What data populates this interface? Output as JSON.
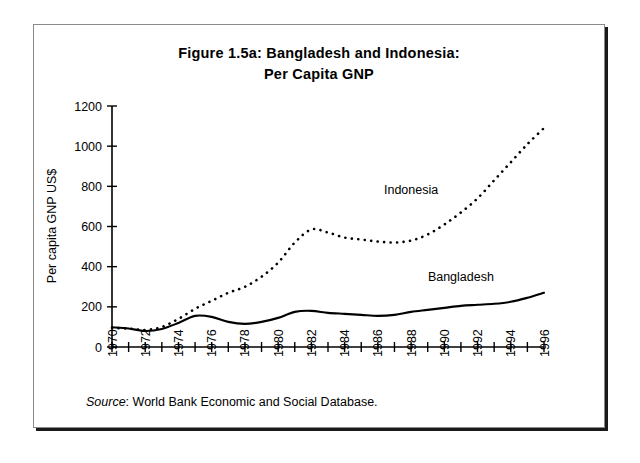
{
  "figure": {
    "title_line1": "Figure 1.5a: Bangladesh and Indonesia:",
    "title_line2": "Per Capita GNP",
    "source_word": "Source",
    "source_text": ": World Bank Economic and Social Database.",
    "frame_color": "#1a1a1a",
    "background": "#ffffff"
  },
  "chart_data": {
    "type": "line",
    "title": "Figure 1.5a: Bangladesh and Indonesia: Per Capita GNP",
    "xlabel": "",
    "ylabel": "Per capita GNP US$",
    "xlim": [
      1970,
      1996
    ],
    "ylim": [
      0,
      1200
    ],
    "ytick_step": 200,
    "xtick_step": 1,
    "xtick_label_step": 2,
    "grid": false,
    "legend_position": "inline-annotation",
    "yticks": [
      "0",
      "200",
      "400",
      "600",
      "800",
      "1000",
      "1200"
    ],
    "xticks": [
      "1970",
      "1971",
      "1972",
      "1973",
      "1974",
      "1975",
      "1976",
      "1977",
      "1978",
      "1979",
      "1980",
      "1981",
      "1982",
      "1983",
      "1984",
      "1985",
      "1986",
      "1987",
      "1988",
      "1989",
      "1990",
      "1991",
      "1992",
      "1993",
      "1994",
      "1995",
      "1996"
    ],
    "xtick_labels_shown": [
      "1970",
      "1972",
      "1974",
      "1976",
      "1978",
      "1980",
      "1982",
      "1984",
      "1986",
      "1988",
      "1990",
      "1992",
      "1994",
      "1996"
    ],
    "x": [
      1970,
      1971,
      1972,
      1973,
      1974,
      1975,
      1976,
      1977,
      1978,
      1979,
      1980,
      1981,
      1982,
      1983,
      1984,
      1985,
      1986,
      1987,
      1988,
      1989,
      1990,
      1991,
      1992,
      1993,
      1994,
      1995,
      1996
    ],
    "series": [
      {
        "name": "Indonesia",
        "style": "dotted",
        "color": "#000000",
        "values": [
          95,
          92,
          85,
          100,
          140,
          190,
          230,
          270,
          300,
          350,
          420,
          520,
          585,
          570,
          545,
          535,
          525,
          520,
          530,
          560,
          610,
          670,
          740,
          830,
          920,
          1010,
          1090
        ]
      },
      {
        "name": "Bangladesh",
        "style": "solid",
        "color": "#000000",
        "values": [
          98,
          92,
          80,
          90,
          120,
          155,
          150,
          125,
          115,
          125,
          145,
          175,
          180,
          170,
          165,
          160,
          155,
          160,
          175,
          185,
          195,
          205,
          210,
          215,
          225,
          245,
          270
        ]
      }
    ],
    "annotations": [
      {
        "text": "Indonesia",
        "x": 1988,
        "y": 760
      },
      {
        "text": "Bangladesh",
        "x": 1991,
        "y": 330
      }
    ]
  }
}
